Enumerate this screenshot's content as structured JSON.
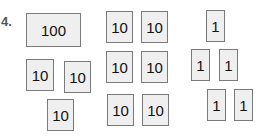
{
  "problem_label": "4.",
  "blocks": [
    {
      "value": "100",
      "x": 26,
      "y": 13,
      "w": 55,
      "h": 34
    },
    {
      "value": "10",
      "x": 26,
      "y": 59,
      "w": 28,
      "h": 32
    },
    {
      "value": "10",
      "x": 64,
      "y": 61,
      "w": 27,
      "h": 32
    },
    {
      "value": "10",
      "x": 47,
      "y": 99,
      "w": 27,
      "h": 32
    },
    {
      "value": "10",
      "x": 106,
      "y": 11,
      "w": 27,
      "h": 32
    },
    {
      "value": "10",
      "x": 141,
      "y": 11,
      "w": 27,
      "h": 32
    },
    {
      "value": "10",
      "x": 106,
      "y": 51,
      "w": 27,
      "h": 32
    },
    {
      "value": "10",
      "x": 141,
      "y": 51,
      "w": 27,
      "h": 32
    },
    {
      "value": "10",
      "x": 107,
      "y": 94,
      "w": 27,
      "h": 32
    },
    {
      "value": "10",
      "x": 142,
      "y": 94,
      "w": 27,
      "h": 32
    },
    {
      "value": "1",
      "x": 206,
      "y": 10,
      "w": 19,
      "h": 32
    },
    {
      "value": "1",
      "x": 191,
      "y": 49,
      "w": 19,
      "h": 32
    },
    {
      "value": "1",
      "x": 219,
      "y": 49,
      "w": 19,
      "h": 32
    },
    {
      "value": "1",
      "x": 207,
      "y": 89,
      "w": 19,
      "h": 32
    },
    {
      "value": "1",
      "x": 234,
      "y": 89,
      "w": 19,
      "h": 32
    }
  ]
}
